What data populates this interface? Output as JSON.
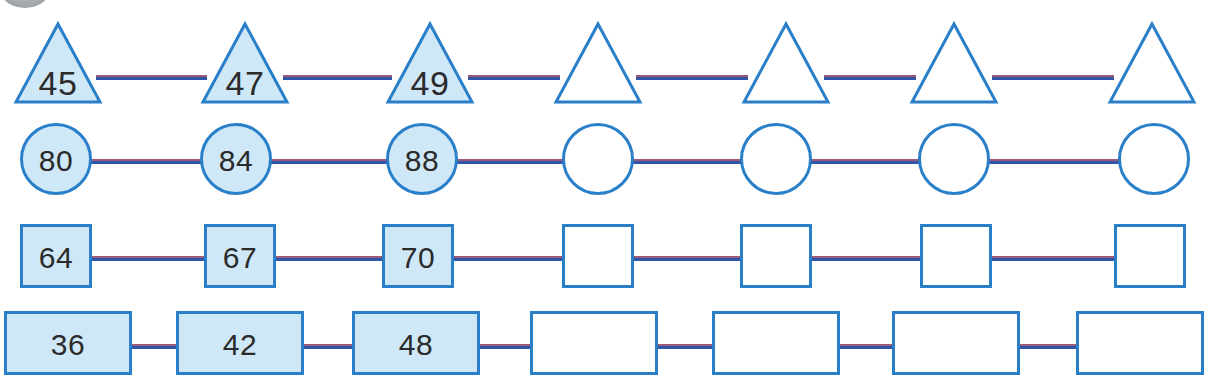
{
  "worksheet": {
    "type": "number-sequence-worksheet",
    "background_color": "#ffffff",
    "shape_fill_color": "#cfe8f8",
    "shape_border_color": "#2a7fc9",
    "connector_top_color": "#9d5a74",
    "connector_bottom_color": "#2f56a8",
    "label_color": "#2b2b2b",
    "corner_badge": {
      "name": "partial-gray-oval",
      "color": "#9fa3a6"
    },
    "rows": [
      {
        "name": "triangle-sequence",
        "shape": "triangle",
        "step": 2,
        "cells": [
          {
            "value": "45",
            "filled": true
          },
          {
            "value": "47",
            "filled": true
          },
          {
            "value": "49",
            "filled": true
          },
          {
            "value": "",
            "filled": false
          },
          {
            "value": "",
            "filled": false
          },
          {
            "value": "",
            "filled": false
          },
          {
            "value": "",
            "filled": false
          }
        ]
      },
      {
        "name": "circle-sequence",
        "shape": "circle",
        "step": 4,
        "cells": [
          {
            "value": "80",
            "filled": true
          },
          {
            "value": "84",
            "filled": true
          },
          {
            "value": "88",
            "filled": true
          },
          {
            "value": "",
            "filled": false
          },
          {
            "value": "",
            "filled": false
          },
          {
            "value": "",
            "filled": false
          },
          {
            "value": "",
            "filled": false
          }
        ]
      },
      {
        "name": "square-sequence",
        "shape": "square",
        "step": 3,
        "cells": [
          {
            "value": "64",
            "filled": true
          },
          {
            "value": "67",
            "filled": true
          },
          {
            "value": "70",
            "filled": true
          },
          {
            "value": "",
            "filled": false
          },
          {
            "value": "",
            "filled": false
          },
          {
            "value": "",
            "filled": false
          },
          {
            "value": "",
            "filled": false
          }
        ]
      },
      {
        "name": "rectangle-sequence",
        "shape": "rectangle",
        "step": 6,
        "cells": [
          {
            "value": "36",
            "filled": true
          },
          {
            "value": "42",
            "filled": true
          },
          {
            "value": "48",
            "filled": true
          },
          {
            "value": "",
            "filled": false
          },
          {
            "value": "",
            "filled": false
          },
          {
            "value": "",
            "filled": false
          },
          {
            "value": "",
            "filled": false
          }
        ]
      }
    ]
  }
}
